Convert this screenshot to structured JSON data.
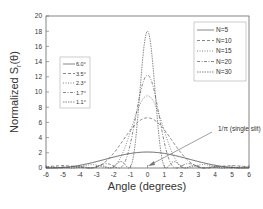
{
  "chart_data": {
    "type": "line",
    "title": "",
    "xlabel": "Angle (degrees)",
    "ylabel": "Normalized S_r(θ)",
    "xlim": [
      -6,
      6
    ],
    "ylim": [
      0,
      20
    ],
    "xticks": [
      -6,
      -5,
      -4,
      -3,
      -2,
      -1,
      0,
      1,
      2,
      3,
      4,
      5,
      6
    ],
    "yticks": [
      0,
      2,
      4,
      6,
      8,
      10,
      12,
      14,
      16,
      18,
      20
    ],
    "grid": false,
    "series": [
      {
        "name": "N=5",
        "width_label": "6.0°",
        "dash": "solid",
        "peak": 2.1,
        "half_width_deg": 3.0
      },
      {
        "name": "N=10",
        "width_label": "3.5°",
        "dash": "dash",
        "peak": 6.6,
        "half_width_deg": 1.75
      },
      {
        "name": "N=15",
        "width_label": "2.3°",
        "dash": "dot",
        "peak": 9.5,
        "half_width_deg": 1.15
      },
      {
        "name": "N=20",
        "width_label": "1.7°",
        "dash": "dashdot",
        "peak": 12.2,
        "half_width_deg": 0.85
      },
      {
        "name": "N=30",
        "width_label": "1.1°",
        "dash": "shortdash",
        "peak": 18.0,
        "half_width_deg": 0.55
      }
    ],
    "legends": {
      "left": [
        "6.0°",
        "3.5°",
        "2.3°",
        "1.7°",
        "1.1°"
      ],
      "right": [
        "N=5",
        "N=10",
        "N=15",
        "N=20",
        "N=30"
      ]
    },
    "annotations": [
      {
        "text": "1/π (single slit)",
        "arrow_to": [
          0,
          0.4
        ]
      }
    ]
  },
  "labels": {
    "xlabel": "Angle (degrees)",
    "ylabel_main": "Normalized S",
    "ylabel_sub": "r",
    "ylabel_tail": "(θ)",
    "annotation": "1/π (single slit)"
  }
}
